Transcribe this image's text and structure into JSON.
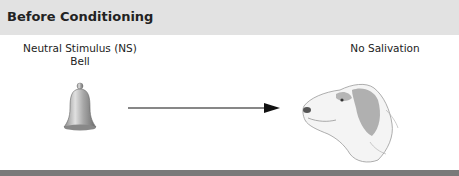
{
  "header": {
    "title": "Before Conditioning"
  },
  "stimulus": {
    "line1": "Neutral Stimulus (NS)",
    "line2": "Bell",
    "icon": "bell-icon"
  },
  "response": {
    "label": "No Salivation",
    "icon": "dog-head-illustration"
  },
  "colors": {
    "header_bg": "#e2e2e2",
    "footer_bar": "#7a7a7a",
    "arrow": "#111111"
  }
}
